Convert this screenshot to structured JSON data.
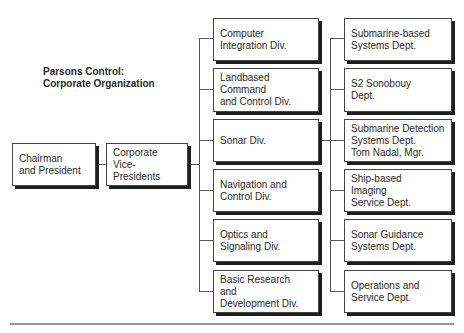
{
  "title": {
    "line1": "Parsons Control:",
    "line2": "Corporate Organization"
  },
  "top": {
    "chairman": "Chairman\nand President",
    "vice_presidents": "Corporate\nVice-Presidents"
  },
  "divisions": [
    {
      "label": "Computer\nIntegration Div."
    },
    {
      "label": "Landbased\nCommand\nand Control Div."
    },
    {
      "label": "Sonar Div."
    },
    {
      "label": "Navigation and\nControl Div."
    },
    {
      "label": "Optics and\nSignaling Div."
    },
    {
      "label": "Basic Research\nand\nDevelopment Div."
    }
  ],
  "departments": [
    {
      "label": "Submarine-based\nSystems Dept."
    },
    {
      "label": "S2 Sonobouy\nDept."
    },
    {
      "label": "Submarine Detection\nSystems Dept.\nTom Nadal, Mgr."
    },
    {
      "label": "Ship-based\nImaging\nService Dept."
    },
    {
      "label": "Sonar Guidance\nSystems Dept."
    },
    {
      "label": "Operations and\nService Dept."
    }
  ]
}
